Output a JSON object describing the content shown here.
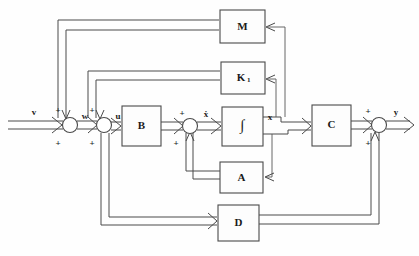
{
  "figure": {
    "type": "control-system-block-diagram",
    "caption": ""
  },
  "blocks": [
    {
      "id": "M",
      "label": "M",
      "sub": "",
      "x": 220,
      "y": 10,
      "w": 45,
      "h": 33,
      "kind": "gain"
    },
    {
      "id": "K1",
      "label": "K",
      "sub": "1",
      "x": 221,
      "y": 62,
      "w": 44,
      "h": 32,
      "kind": "gain"
    },
    {
      "id": "INT",
      "label": "∫",
      "sub": "",
      "x": 222,
      "y": 107,
      "w": 41,
      "h": 39,
      "kind": "integrator"
    },
    {
      "id": "A",
      "label": "A",
      "sub": "",
      "x": 220,
      "y": 162,
      "w": 43,
      "h": 31,
      "kind": "gain"
    },
    {
      "id": "D",
      "label": "D",
      "sub": "",
      "x": 218,
      "y": 205,
      "w": 41,
      "h": 36,
      "kind": "gain"
    },
    {
      "id": "B",
      "label": "B",
      "sub": "",
      "x": 122,
      "y": 106,
      "w": 39,
      "h": 40,
      "kind": "gain"
    },
    {
      "id": "C",
      "label": "C",
      "sub": "",
      "x": 312,
      "y": 105,
      "w": 39,
      "h": 41,
      "kind": "gain"
    }
  ],
  "junctions": [
    {
      "id": "sum-w",
      "cx": 70,
      "cy": 125,
      "r": 7.5
    },
    {
      "id": "sum-u",
      "cx": 104,
      "cy": 125,
      "r": 7.5
    },
    {
      "id": "sum-xd",
      "cx": 190,
      "cy": 126,
      "r": 7.5
    },
    {
      "id": "sum-y",
      "cx": 379,
      "cy": 125,
      "r": 7.5
    }
  ],
  "signals": {
    "v": "v",
    "w": "w",
    "u": "u",
    "xdot": "ẋ",
    "x": "x",
    "y": "y"
  },
  "signs": {
    "sum_w_top": "+",
    "sum_w_bottom": "+",
    "sum_u_top": "+",
    "sum_u_bottom": "+",
    "sum_xd_top": "+",
    "sum_xd_bottom": "+",
    "sum_y_top": "+",
    "sum_y_bottom": "+"
  },
  "colors": {
    "wire": "#4a4a4a",
    "block_fill": "#fdfdfd",
    "text": "#1a1a1a",
    "background": "#fefefe"
  }
}
